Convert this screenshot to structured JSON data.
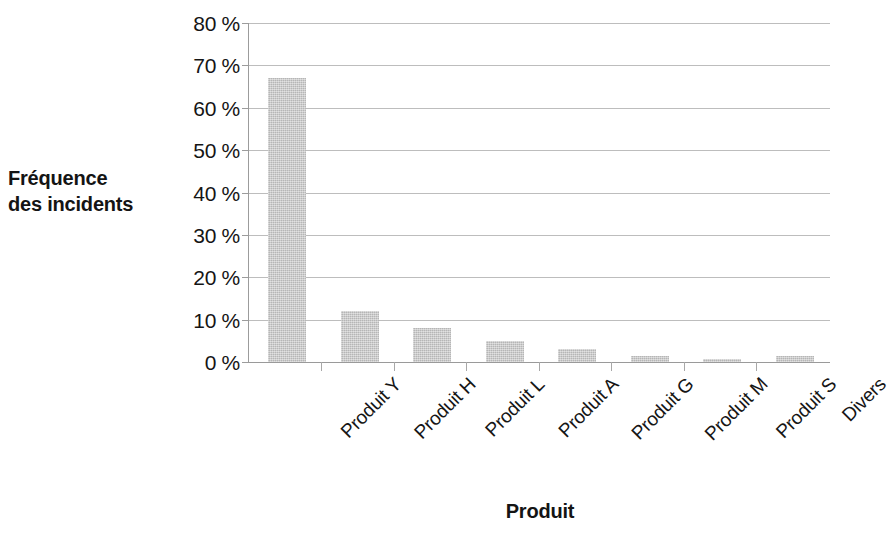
{
  "chart_data": {
    "type": "bar",
    "title": "",
    "xlabel": "Produit",
    "ylabel": "Fréquence\ndes incidents",
    "categories": [
      "Produit Y",
      "Produit H",
      "Produit L",
      "Produit A",
      "Produit G",
      "Produit M",
      "Produit S",
      "Divers"
    ],
    "values": [
      67,
      12,
      8,
      5,
      3,
      1.5,
      0.7,
      1.5
    ],
    "ylim": [
      0,
      80
    ],
    "ytick_labels": [
      "80 %",
      "70 %",
      "60 %",
      "50 %",
      "40 %",
      "30 %",
      "20 %",
      "10 %",
      "0 %"
    ],
    "ytick_values": [
      80,
      70,
      60,
      50,
      40,
      30,
      20,
      10,
      0
    ],
    "grid": true,
    "legend": "none",
    "bar_color": "#c8c8c8",
    "axis_color": "#9c9c9c",
    "grid_color": "#bdbdbd",
    "text_color": "#151515"
  }
}
